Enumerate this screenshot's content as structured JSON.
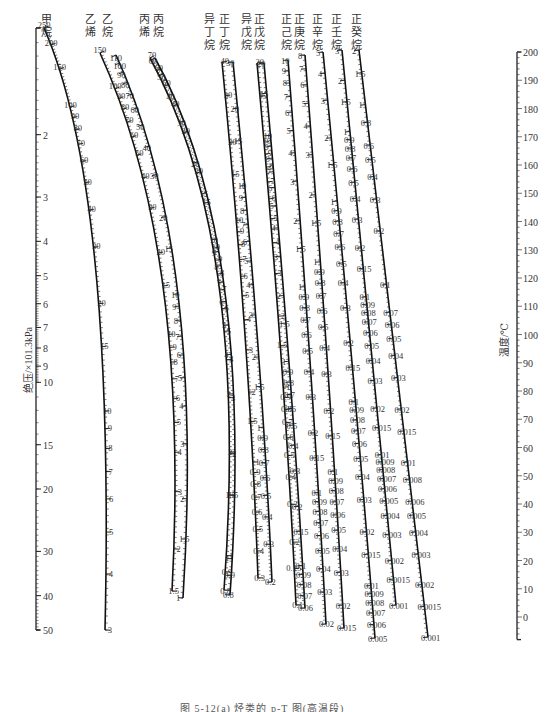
{
  "chart_data": {
    "type": "nomogram",
    "title": "烃类的 p-T 图(高温段)",
    "caption": "图 5-12(a) 烃类的 p-T 图(高温段)",
    "left_axis": {
      "label": "绝压/×101.3kPa",
      "scale": "log",
      "range": [
        1,
        50
      ],
      "ticks": [
        1,
        2,
        3,
        4,
        5,
        6,
        7,
        8,
        9,
        10,
        15,
        20,
        30,
        40,
        50
      ]
    },
    "right_axis": {
      "label": "温度/℃",
      "scale": "linear",
      "range": [
        -10,
        200
      ],
      "ticks": [
        200,
        190,
        180,
        170,
        160,
        150,
        140,
        130,
        120,
        110,
        100,
        90,
        80,
        70,
        60,
        50,
        40,
        30,
        20,
        10,
        0
      ]
    },
    "series": [
      {
        "name": "甲烷",
        "ticks": [
          250,
          200,
          150,
          100,
          90,
          80,
          70,
          60,
          50,
          40,
          30,
          20,
          15,
          10,
          9,
          8,
          7,
          6,
          5,
          4,
          3
        ]
      },
      {
        "name": "乙烯",
        "ticks": [
          150,
          100,
          90,
          80,
          70,
          60,
          50,
          40,
          30,
          20,
          15,
          10,
          9,
          8,
          7,
          6,
          5,
          4,
          3,
          2,
          1.5
        ]
      },
      {
        "name": "乙烷",
        "ticks": [
          110,
          100,
          90,
          80,
          70,
          60,
          50,
          40,
          30,
          20,
          15,
          10,
          9,
          8,
          7,
          6,
          5,
          4,
          3,
          2,
          1.5,
          1
        ]
      },
      {
        "name": "丙烯",
        "ticks": [
          70,
          60,
          50,
          40,
          30,
          20,
          15,
          10,
          9,
          8,
          7,
          6,
          5,
          4,
          3,
          2,
          1.5,
          1.0,
          0.9,
          0.8
        ]
      },
      {
        "name": "丙烷",
        "ticks": [
          60,
          50,
          40,
          30,
          20,
          15,
          10,
          9,
          8,
          7,
          6,
          5,
          4,
          3,
          2,
          1.5,
          1.0,
          0.9,
          0.8
        ]
      },
      {
        "name": "异丁烷",
        "ticks": [
          40,
          30,
          20,
          15,
          10,
          9,
          8,
          7,
          6,
          5,
          4,
          3,
          2,
          1.5,
          1.0,
          0.9,
          0.8,
          0.7,
          0.6,
          0.5,
          0.4,
          0.3
        ]
      },
      {
        "name": "正丁烷",
        "ticks": [
          30,
          20,
          15,
          10,
          9,
          8,
          7,
          6,
          5,
          4,
          3,
          2,
          1.5,
          1.0,
          0.9,
          0.8,
          0.7,
          0.6,
          0.5,
          0.4,
          0.3,
          0.2
        ]
      },
      {
        "name": "异戊烷",
        "ticks": [
          20,
          15,
          10,
          9,
          8,
          7,
          6,
          5,
          4,
          3,
          2,
          1.5,
          1.0,
          0.9,
          0.8,
          0.7,
          0.6,
          0.5,
          0.4,
          0.3,
          0.2,
          0.15,
          0.1
        ]
      },
      {
        "name": "正戊烷",
        "ticks": [
          20,
          15,
          10,
          9,
          8,
          7,
          6,
          5,
          4,
          3,
          2,
          1.5,
          1.0,
          0.9,
          0.8,
          0.7,
          0.6,
          0.5,
          0.4,
          0.3,
          0.2,
          0.15,
          0.1,
          0.09,
          0.08,
          0.07,
          0.06
        ]
      },
      {
        "name": "正己烷",
        "ticks": [
          10,
          9,
          8,
          7,
          6,
          5,
          4,
          3,
          2,
          1.5,
          1.0,
          0.9,
          0.8,
          0.7,
          0.6,
          0.5,
          0.4,
          0.3,
          0.2,
          0.15,
          0.1,
          0.09,
          0.08,
          0.07,
          0.06,
          0.05,
          0.04,
          0.03,
          0.02
        ]
      },
      {
        "name": "正庚烷",
        "ticks": [
          8,
          7,
          6,
          5,
          4,
          3,
          2,
          1.5,
          1.0,
          0.9,
          0.8,
          0.7,
          0.6,
          0.5,
          0.4,
          0.3,
          0.2,
          0.15,
          0.1,
          0.09,
          0.08,
          0.07,
          0.06,
          0.05,
          0.04,
          0.03,
          0.02,
          0.015
        ]
      },
      {
        "name": "正辛烷",
        "ticks": [
          5,
          4,
          3,
          2,
          1.5,
          1.0,
          0.9,
          0.8,
          0.7,
          0.6,
          0.5,
          0.4,
          0.3,
          0.2,
          0.15,
          0.1,
          0.09,
          0.08,
          0.07,
          0.06,
          0.05,
          0.04,
          0.03,
          0.02,
          0.015,
          0.01,
          0.009,
          0.008,
          0.007,
          0.006,
          0.005
        ]
      },
      {
        "name": "正壬烷",
        "ticks": [
          3,
          2,
          1.5,
          1.0,
          0.9,
          0.8,
          0.7,
          0.6,
          0.5,
          0.4,
          0.3,
          0.2,
          0.15,
          0.1,
          0.09,
          0.08,
          0.07,
          0.06,
          0.05,
          0.04,
          0.03,
          0.02,
          0.015,
          0.01,
          0.009,
          0.008,
          0.007,
          0.006,
          0.005,
          0.004,
          0.003,
          0.002,
          0.0015,
          0.001
        ]
      },
      {
        "name": "正癸烷",
        "ticks": [
          2,
          1.5,
          1.0,
          0.8,
          0.6,
          0.5,
          0.4,
          0.3,
          0.2,
          0.1,
          0.07,
          0.06,
          0.05,
          0.04,
          0.03,
          0.02,
          0.015,
          0.01,
          0.008,
          0.006,
          0.005,
          0.004,
          0.003,
          0.002,
          0.0015,
          0.001
        ]
      }
    ]
  },
  "headers": [
    {
      "chars": [
        "甲",
        "烷"
      ],
      "x": 46
    },
    {
      "chars": [
        "乙",
        "烯"
      ],
      "x": 90
    },
    {
      "chars": [
        "乙",
        "烷"
      ],
      "x": 107
    },
    {
      "chars": [
        "丙",
        "烯"
      ],
      "x": 144
    },
    {
      "chars": [
        "丙",
        "烷"
      ],
      "x": 158
    },
    {
      "chars": [
        "异",
        "丁",
        "烷"
      ],
      "x": 209
    },
    {
      "chars": [
        "正",
        "丁",
        "烷"
      ],
      "x": 224
    },
    {
      "chars": [
        "异",
        "戊",
        "烷"
      ],
      "x": 246
    },
    {
      "chars": [
        "正",
        "戊",
        "烷"
      ],
      "x": 259
    },
    {
      "chars": [
        "正",
        "己",
        "烷"
      ],
      "x": 286
    },
    {
      "chars": [
        "正",
        "庚",
        "烷"
      ],
      "x": 299
    },
    {
      "chars": [
        "正",
        "辛",
        "烷"
      ],
      "x": 317
    },
    {
      "chars": [
        "正",
        "壬",
        "烷"
      ],
      "x": 336
    },
    {
      "chars": [
        "正",
        "癸",
        "烷"
      ],
      "x": 356
    }
  ]
}
